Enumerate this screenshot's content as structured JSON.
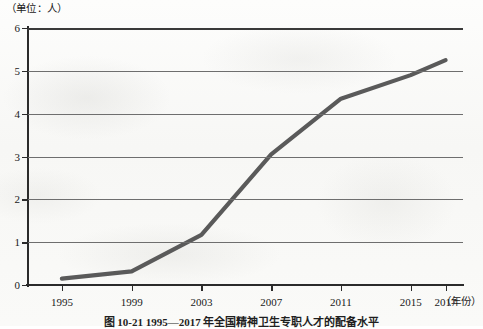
{
  "unit_label": "（单位：人）",
  "x_axis_title": "（年份）",
  "figure_caption": "图 10-21  1995—2017 年全国精神卫生专职人才的配备水平",
  "chart_data": {
    "type": "line",
    "title": "",
    "subtitle": "",
    "xlabel": "（年份）",
    "ylabel": "（单位：人）",
    "xlim": [
      1993,
      2018
    ],
    "ylim": [
      0,
      6
    ],
    "grid": true,
    "legend": "none",
    "line_color": "#5a5a5a",
    "x": [
      1995,
      1999,
      2003,
      2007,
      2011,
      2015,
      2017
    ],
    "categories": [
      "1995",
      "1999",
      "2003",
      "2007",
      "2011",
      "2015",
      "2017"
    ],
    "values": [
      0.15,
      0.32,
      1.17,
      3.05,
      4.35,
      4.9,
      5.25
    ],
    "y_ticks": [
      0,
      1,
      2,
      3,
      4,
      5,
      6
    ],
    "y_tick_labels": [
      "0",
      "1",
      "2",
      "3",
      "4",
      "5",
      "6"
    ],
    "x_ticks": [
      1995,
      1999,
      2003,
      2007,
      2011,
      2015,
      2017
    ],
    "x_tick_labels": [
      "1995",
      "1999",
      "2003",
      "2007",
      "2011",
      "2015",
      "2017"
    ],
    "series": [
      {
        "name": "精神卫生专职人才配备水平",
        "values": [
          0.15,
          0.32,
          1.17,
          3.05,
          4.35,
          4.9,
          5.25
        ]
      }
    ]
  }
}
